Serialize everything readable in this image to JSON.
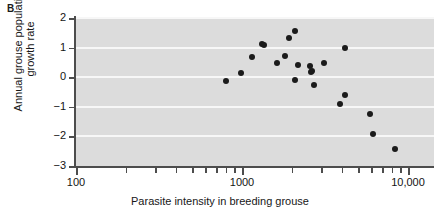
{
  "panel": {
    "label": "B"
  },
  "chart_data": {
    "type": "scatter",
    "title": "",
    "xlabel": "Parasite intensity in breeding grouse",
    "ylabel": "Annual grouse population growth rate",
    "ylabel_line1": "Annual grouse population",
    "ylabel_line2": "growth rate",
    "xscale": "log",
    "yscale": "linear",
    "xlim": [
      100,
      10000
    ],
    "ylim": [
      -3,
      2
    ],
    "grid": "horizontal-white",
    "legend": "none",
    "xticks_major": [
      {
        "value": 100,
        "label": "100"
      },
      {
        "value": 1000,
        "label": "1000"
      },
      {
        "value": 10000,
        "label": "10,000"
      }
    ],
    "xticks_minor": [
      200,
      300,
      400,
      500,
      600,
      700,
      800,
      900,
      2000,
      3000,
      4000,
      5000,
      6000,
      7000,
      8000,
      9000
    ],
    "yticks": [
      {
        "value": 2,
        "label": "2"
      },
      {
        "value": 1,
        "label": "1"
      },
      {
        "value": 0,
        "label": "0"
      },
      {
        "value": -1,
        "label": "−1"
      },
      {
        "value": -2,
        "label": "−2"
      },
      {
        "value": -3,
        "label": "−3"
      }
    ],
    "points": [
      {
        "x": 800,
        "y": -0.14
      },
      {
        "x": 980,
        "y": 0.14
      },
      {
        "x": 1150,
        "y": 0.68
      },
      {
        "x": 1320,
        "y": 1.13
      },
      {
        "x": 1360,
        "y": 1.08
      },
      {
        "x": 1620,
        "y": 0.48
      },
      {
        "x": 1810,
        "y": 0.7
      },
      {
        "x": 1930,
        "y": 1.33
      },
      {
        "x": 2080,
        "y": 1.55
      },
      {
        "x": 2080,
        "y": -0.09
      },
      {
        "x": 2180,
        "y": 0.41
      },
      {
        "x": 2560,
        "y": 0.39
      },
      {
        "x": 2600,
        "y": 0.17
      },
      {
        "x": 2640,
        "y": 0.22
      },
      {
        "x": 2720,
        "y": -0.28
      },
      {
        "x": 3100,
        "y": 0.47
      },
      {
        "x": 3900,
        "y": -0.89
      },
      {
        "x": 4150,
        "y": -0.6
      },
      {
        "x": 4200,
        "y": 1.0
      },
      {
        "x": 5900,
        "y": -1.25
      },
      {
        "x": 6150,
        "y": -1.93
      },
      {
        "x": 8400,
        "y": -2.42
      }
    ]
  },
  "colors": {
    "plot_background": "#dcdcdc",
    "gridline": "#f7f7f7",
    "axis": "#4d4d4d",
    "marker": "#1b1b1b",
    "text": "#141414"
  }
}
